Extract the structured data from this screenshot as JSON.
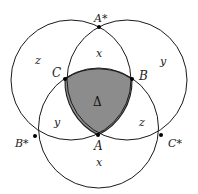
{
  "diagram": {
    "circles": [
      {
        "name": "left",
        "cx": 71,
        "cy": 80,
        "r": 60
      },
      {
        "name": "right",
        "cx": 127,
        "cy": 80,
        "r": 60
      },
      {
        "name": "bottom",
        "cx": 98.5,
        "cy": 128,
        "r": 60
      }
    ],
    "colors": {
      "stroke": "#1a1a1a",
      "shaded": "#8c8c8c",
      "background": "#ffffff"
    },
    "points": {
      "A_star": {
        "label": "A*",
        "x": 99,
        "y": 27
      },
      "C": {
        "label": "C",
        "x": 65,
        "y": 79
      },
      "B": {
        "label": "B",
        "x": 132,
        "y": 79
      },
      "A": {
        "label": "A",
        "x": 98,
        "y": 135
      },
      "B_star": {
        "label": "B*",
        "x": 35,
        "y": 136
      },
      "C_star": {
        "label": "C*",
        "x": 161,
        "y": 135
      }
    },
    "regions": {
      "top_x": "x",
      "left_z": "z",
      "right_y": "y",
      "center": "Δ",
      "bottom_left_y": "y",
      "bottom_right_z": "z",
      "bottom_x": "x"
    }
  }
}
